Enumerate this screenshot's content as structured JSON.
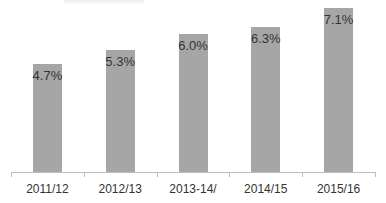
{
  "chart_data": {
    "type": "bar",
    "title": "",
    "xlabel": "",
    "ylabel": "",
    "categories": [
      "2011/12",
      "2012/13",
      "2013-14/",
      "2014/15",
      "2015/16"
    ],
    "values": [
      4.7,
      5.3,
      6.0,
      6.3,
      7.1
    ],
    "value_labels": [
      "4.7%",
      "5.3%",
      "6.0%",
      "6.3%",
      "7.1%"
    ],
    "grid": false,
    "legend": null,
    "bar_color": "#a6a6a6"
  }
}
